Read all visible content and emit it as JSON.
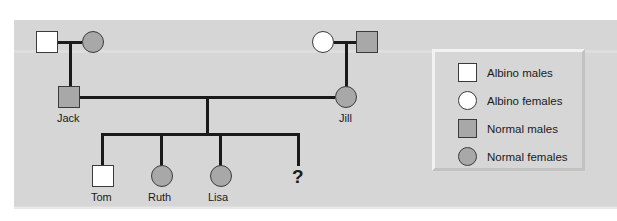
{
  "figure": {
    "type": "pedigree-chart",
    "background_color": "#d6d6d6",
    "symbol_stroke_color": "#3b3b3b",
    "line_color": "#1a1a1a",
    "normal_fill_color": "#a8a8a8",
    "albino_fill_color": "#ffffff"
  },
  "generation1": {
    "left_couple": {
      "father": {
        "name": "",
        "shape": "square",
        "fill": "white",
        "meaning": "albino-male"
      },
      "mother": {
        "name": "",
        "shape": "circle",
        "fill": "gray",
        "meaning": "normal-female"
      }
    },
    "right_couple": {
      "mother": {
        "name": "",
        "shape": "circle",
        "fill": "white",
        "meaning": "albino-female"
      },
      "father": {
        "name": "",
        "shape": "square",
        "fill": "gray",
        "meaning": "normal-male"
      }
    }
  },
  "generation2": {
    "father": {
      "name": "Jack",
      "shape": "square",
      "fill": "gray",
      "meaning": "normal-male"
    },
    "mother": {
      "name": "Jill",
      "shape": "circle",
      "fill": "gray",
      "meaning": "normal-female"
    }
  },
  "generation3": {
    "children": [
      {
        "name": "Tom",
        "shape": "square",
        "fill": "white",
        "meaning": "albino-male"
      },
      {
        "name": "Ruth",
        "shape": "circle",
        "fill": "gray",
        "meaning": "normal-female"
      },
      {
        "name": "Lisa",
        "shape": "circle",
        "fill": "gray",
        "meaning": "normal-female"
      },
      {
        "name": "?",
        "shape": "unknown",
        "fill": "none",
        "meaning": "unknown-offspring"
      }
    ]
  },
  "legend": {
    "items": [
      {
        "shape": "square",
        "fill": "white",
        "label": "Albino males"
      },
      {
        "shape": "circle",
        "fill": "white",
        "label": "Albino females"
      },
      {
        "shape": "square",
        "fill": "gray",
        "label": "Normal males"
      },
      {
        "shape": "circle",
        "fill": "gray",
        "label": "Normal females"
      }
    ]
  }
}
